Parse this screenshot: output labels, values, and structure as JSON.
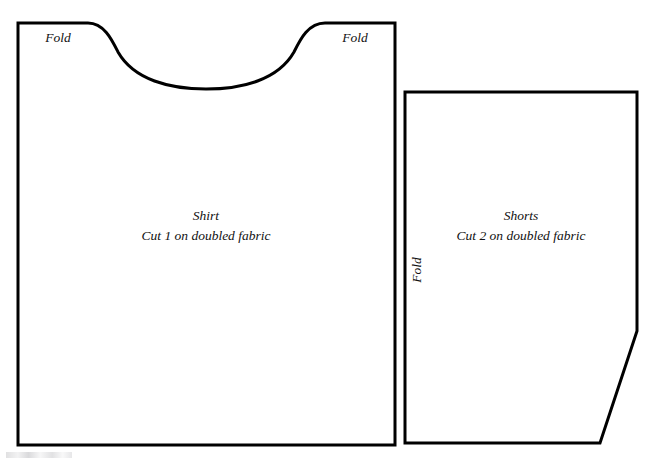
{
  "document": {
    "type": "sewing-pattern-diagram",
    "background_color": "#ffffff",
    "line_color": "#000000",
    "text_color": "#111111",
    "line_width_px": 3,
    "width_px": 662,
    "height_px": 468
  },
  "pieces": [
    {
      "id": "shirt",
      "name": "Shirt",
      "title": "Shirt",
      "instruction": "Cut 1 on doubled fabric",
      "cut_quantity": 1,
      "label_center_x": 206,
      "title_y": 220,
      "instruction_y": 240,
      "outline_path": "M 18 23 L 88 23 C 104 23 112 40 118 52 C 134 80 170 89 206 89 C 242 89 278 80 294 52 C 300 40 308 23 325 23 L 395 23 L 395 445 L 18 445 Z",
      "fold_labels": [
        {
          "text": "Fold",
          "x": 58,
          "y": 42,
          "orientation": "horizontal",
          "position": "top-left-shoulder"
        },
        {
          "text": "Fold",
          "x": 355,
          "y": 42,
          "orientation": "horizontal",
          "position": "top-right-shoulder"
        }
      ]
    },
    {
      "id": "shorts",
      "name": "Shorts",
      "title": "Shorts",
      "instruction": "Cut 2 on doubled fabric",
      "cut_quantity": 2,
      "label_center_x": 521,
      "title_y": 220,
      "instruction_y": 240,
      "outline_path": "M 405 92 L 637 92 L 637 331 L 600 443 L 405 443 Z",
      "fold_labels": [
        {
          "text": "Fold",
          "x": 421,
          "y": 270,
          "orientation": "vertical-ccw",
          "position": "left-edge"
        }
      ]
    }
  ],
  "labels": {
    "fold": "Fold"
  }
}
